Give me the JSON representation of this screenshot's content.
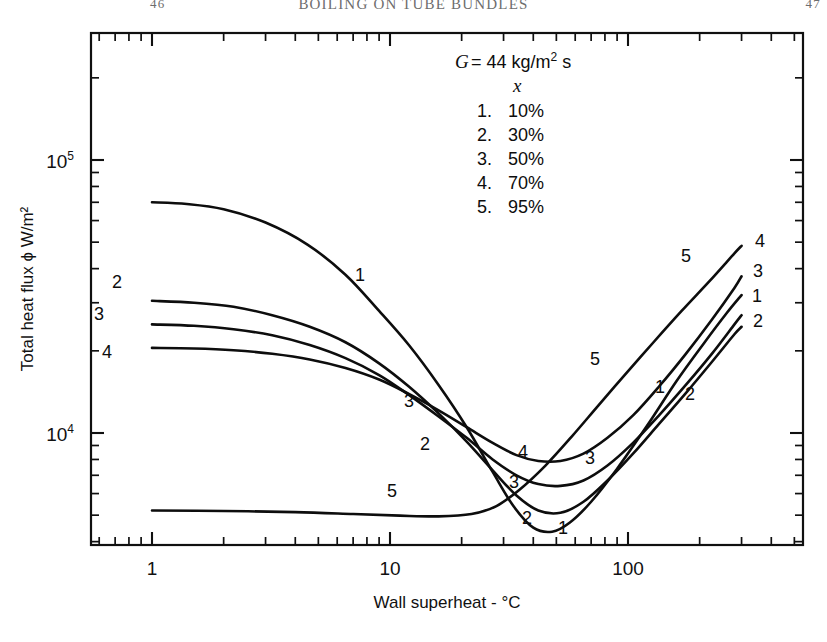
{
  "page": {
    "running_head": "BOILING ON TUBE BUNDLES",
    "folio_left": "46",
    "folio_right": "47"
  },
  "figure": {
    "legend": {
      "mass_flux_symbol": "G",
      "mass_flux_equals": "= 44 kg/m",
      "mass_flux_exponent": "2",
      "mass_flux_unit_tail": "s",
      "quality_symbol": "x",
      "entries": [
        {
          "index": "1.",
          "value": "10%"
        },
        {
          "index": "2.",
          "value": "30%"
        },
        {
          "index": "3.",
          "value": "50%"
        },
        {
          "index": "4.",
          "value": "70%"
        },
        {
          "index": "5.",
          "value": "95%"
        }
      ]
    },
    "labels": {
      "curve_1": "1",
      "curve_2": "2",
      "curve_3": "3",
      "curve_4": "4",
      "curve_5": "5"
    }
  },
  "chart_data": {
    "type": "line",
    "title": "",
    "xlabel": "Wall superheat - °C",
    "ylabel": "Total heat flux ϕ W/m²",
    "xscale": "log",
    "yscale": "log",
    "xlim": [
      0.7,
      320
    ],
    "ylim": [
      3000,
      200000
    ],
    "xticks": [
      1,
      10,
      100
    ],
    "xticklabels": [
      "1",
      "10",
      "100"
    ],
    "yticks": [
      10000,
      100000
    ],
    "yticklabels": [
      "10⁴",
      "10⁵"
    ],
    "grid": false,
    "legend_position": "upper-center",
    "series": [
      {
        "name": "1",
        "label": "10%",
        "quality_percent": 10,
        "points": [
          [
            1.0,
            70000
          ],
          [
            1.4,
            69000
          ],
          [
            2.0,
            66000
          ],
          [
            3.0,
            59000
          ],
          [
            4.5,
            49000
          ],
          [
            6.5,
            38000
          ],
          [
            9.0,
            28000
          ],
          [
            12.0,
            21000
          ],
          [
            16.0,
            15000
          ],
          [
            21.0,
            10500
          ],
          [
            27.0,
            7200
          ],
          [
            33.0,
            5400
          ],
          [
            40.0,
            4500
          ],
          [
            48.0,
            4350
          ],
          [
            57.0,
            4700
          ],
          [
            70.0,
            5600
          ],
          [
            90.0,
            7400
          ],
          [
            120.0,
            10600
          ],
          [
            160.0,
            15500
          ],
          [
            210.0,
            21500
          ],
          [
            260.0,
            27500
          ],
          [
            300.0,
            32000
          ]
        ]
      },
      {
        "name": "2",
        "label": "30%",
        "quality_percent": 30,
        "points": [
          [
            1.0,
            30500
          ],
          [
            1.5,
            30000
          ],
          [
            2.2,
            29000
          ],
          [
            3.2,
            27000
          ],
          [
            4.6,
            24500
          ],
          [
            6.5,
            21500
          ],
          [
            9.0,
            18000
          ],
          [
            12.0,
            14800
          ],
          [
            16.0,
            11800
          ],
          [
            21.0,
            9300
          ],
          [
            27.0,
            7300
          ],
          [
            34.0,
            5900
          ],
          [
            42.0,
            5200
          ],
          [
            52.0,
            5100
          ],
          [
            65.0,
            5600
          ],
          [
            82.0,
            6700
          ],
          [
            105.0,
            8400
          ],
          [
            135.0,
            10800
          ],
          [
            175.0,
            14000
          ],
          [
            225.0,
            18200
          ],
          [
            280.0,
            23000
          ],
          [
            300.0,
            24500
          ]
        ]
      },
      {
        "name": "3",
        "label": "50%",
        "quality_percent": 50,
        "points": [
          [
            1.0,
            25000
          ],
          [
            1.5,
            24700
          ],
          [
            2.2,
            24000
          ],
          [
            3.2,
            22800
          ],
          [
            4.6,
            21000
          ],
          [
            6.5,
            18800
          ],
          [
            9.0,
            16300
          ],
          [
            12.0,
            13800
          ],
          [
            16.0,
            11500
          ],
          [
            21.0,
            9600
          ],
          [
            27.0,
            8000
          ],
          [
            34.0,
            7000
          ],
          [
            42.0,
            6500
          ],
          [
            52.0,
            6400
          ],
          [
            65.0,
            6700
          ],
          [
            82.0,
            7600
          ],
          [
            105.0,
            9200
          ],
          [
            135.0,
            11600
          ],
          [
            175.0,
            15000
          ],
          [
            225.0,
            19500
          ],
          [
            280.0,
            25000
          ],
          [
            300.0,
            27000
          ]
        ]
      },
      {
        "name": "4",
        "label": "70%",
        "quality_percent": 70,
        "points": [
          [
            1.0,
            20500
          ],
          [
            1.5,
            20400
          ],
          [
            2.2,
            20100
          ],
          [
            3.2,
            19500
          ],
          [
            4.6,
            18600
          ],
          [
            6.5,
            17300
          ],
          [
            9.0,
            15700
          ],
          [
            12.0,
            13900
          ],
          [
            16.0,
            12100
          ],
          [
            21.0,
            10500
          ],
          [
            27.0,
            9200
          ],
          [
            34.0,
            8300
          ],
          [
            42.0,
            7900
          ],
          [
            52.0,
            7900
          ],
          [
            65.0,
            8400
          ],
          [
            82.0,
            9600
          ],
          [
            105.0,
            11600
          ],
          [
            135.0,
            14800
          ],
          [
            175.0,
            19500
          ],
          [
            225.0,
            26000
          ],
          [
            280.0,
            34000
          ],
          [
            300.0,
            37500
          ]
        ]
      },
      {
        "name": "5",
        "label": "95%",
        "quality_percent": 95,
        "points": [
          [
            1.0,
            5200
          ],
          [
            2.0,
            5180
          ],
          [
            4.0,
            5130
          ],
          [
            7.0,
            5050
          ],
          [
            11.0,
            4980
          ],
          [
            16.0,
            4950
          ],
          [
            22.0,
            5050
          ],
          [
            28.0,
            5400
          ],
          [
            35.0,
            6200
          ],
          [
            45.0,
            7600
          ],
          [
            58.0,
            9700
          ],
          [
            75.0,
            12600
          ],
          [
            98.0,
            16500
          ],
          [
            128.0,
            21500
          ],
          [
            168.0,
            28000
          ],
          [
            220.0,
            36000
          ],
          [
            280.0,
            45500
          ],
          [
            300.0,
            48500
          ]
        ]
      }
    ],
    "inline_labels": [
      {
        "text": "1",
        "x_px": 360,
        "y_px": 281
      },
      {
        "text": "2",
        "x_px": 117,
        "y_px": 288
      },
      {
        "text": "3",
        "x_px": 99,
        "y_px": 320
      },
      {
        "text": "4",
        "x_px": 107,
        "y_px": 358
      },
      {
        "text": "3",
        "x_px": 409,
        "y_px": 407
      },
      {
        "text": "2",
        "x_px": 425,
        "y_px": 450
      },
      {
        "text": "5",
        "x_px": 392,
        "y_px": 497
      },
      {
        "text": "4",
        "x_px": 523,
        "y_px": 458
      },
      {
        "text": "3",
        "x_px": 514,
        "y_px": 488
      },
      {
        "text": "2",
        "x_px": 527,
        "y_px": 524
      },
      {
        "text": "1",
        "x_px": 563,
        "y_px": 534
      },
      {
        "text": "3",
        "x_px": 590,
        "y_px": 464
      },
      {
        "text": "5",
        "x_px": 595,
        "y_px": 365
      },
      {
        "text": "5",
        "x_px": 686,
        "y_px": 262
      },
      {
        "text": "1",
        "x_px": 660,
        "y_px": 393
      },
      {
        "text": "2",
        "x_px": 690,
        "y_px": 400
      },
      {
        "text": "4",
        "x_px": 760,
        "y_px": 247
      },
      {
        "text": "3",
        "x_px": 758,
        "y_px": 277
      },
      {
        "text": "1",
        "x_px": 757,
        "y_px": 302
      },
      {
        "text": "2",
        "x_px": 758,
        "y_px": 327
      }
    ]
  }
}
